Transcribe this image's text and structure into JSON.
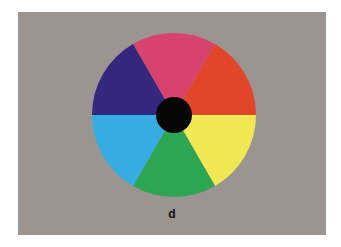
{
  "figure": {
    "label": "d",
    "background_color": "#9a9590",
    "center_color": "#050505",
    "segments": [
      {
        "name": "magenta-pink",
        "color": "#d8426f",
        "start_deg": -120,
        "end_deg": -60
      },
      {
        "name": "red-orange",
        "color": "#e2462a",
        "start_deg": -60,
        "end_deg": 0
      },
      {
        "name": "yellow",
        "color": "#f1e853",
        "start_deg": 0,
        "end_deg": 60
      },
      {
        "name": "green",
        "color": "#2ea553",
        "start_deg": 60,
        "end_deg": 120
      },
      {
        "name": "cyan-blue",
        "color": "#35ade3",
        "start_deg": 120,
        "end_deg": 180
      },
      {
        "name": "indigo",
        "color": "#35277d",
        "start_deg": 180,
        "end_deg": 240
      }
    ]
  }
}
